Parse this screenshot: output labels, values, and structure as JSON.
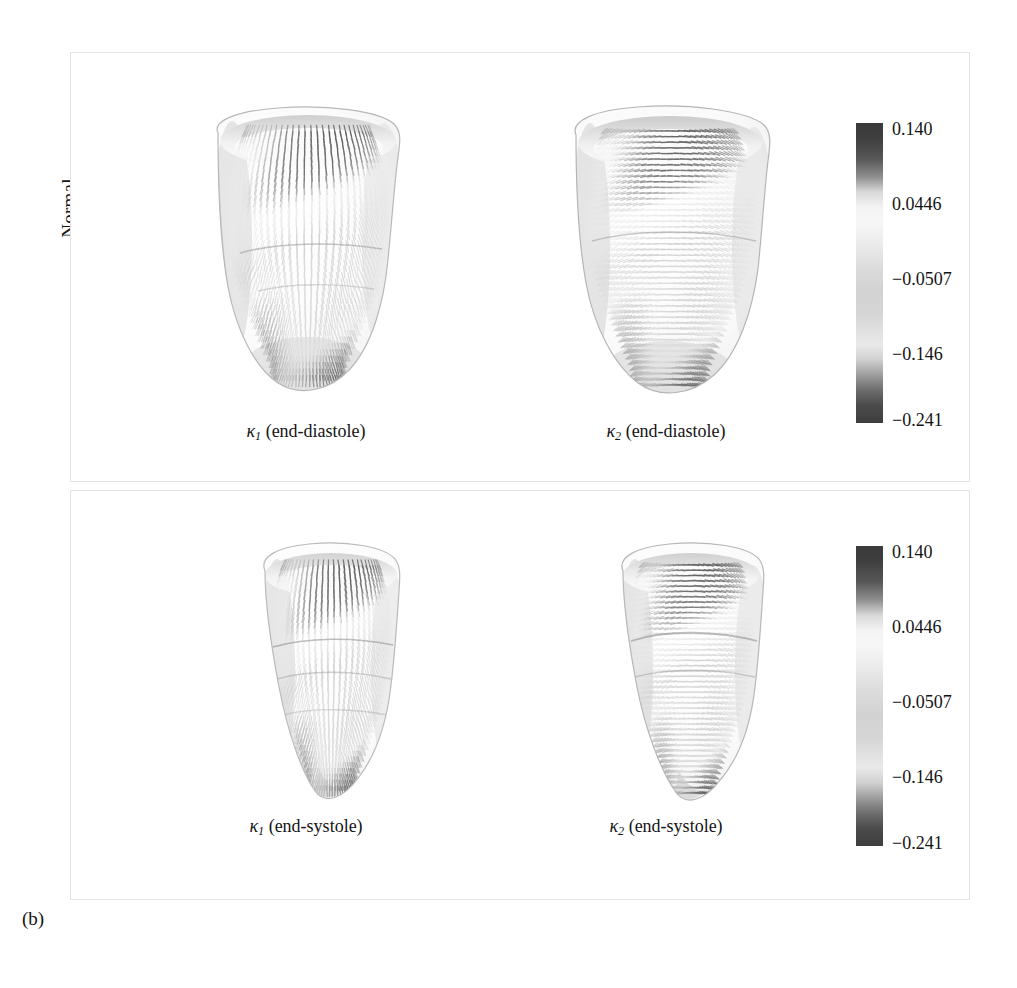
{
  "figure": {
    "caption": "(b)",
    "row_label": "Normal"
  },
  "colorbar": {
    "ticks": [
      "0.140",
      "0.0446",
      "−0.0507",
      "−0.146",
      "−0.241"
    ],
    "tick_positions_pct": [
      2,
      27,
      52,
      77,
      99
    ],
    "colormap": "grayscale-cyclic",
    "min": -0.241,
    "max": 0.14
  },
  "panels": [
    {
      "id": "panel-top",
      "phase": "end-diastole",
      "views": [
        {
          "id": "vent-k1-ed",
          "symbol": "κ",
          "subscript": "1",
          "caption_suffix": " (end-diastole)",
          "caption": "κ₁ (end-diastole)",
          "glyph_direction": "longitudinal"
        },
        {
          "id": "vent-k2-ed",
          "symbol": "κ",
          "subscript": "2",
          "caption_suffix": " (end-diastole)",
          "caption": "κ₂ (end-diastole)",
          "glyph_direction": "circumferential"
        }
      ]
    },
    {
      "id": "panel-bottom",
      "phase": "end-systole",
      "views": [
        {
          "id": "vent-k1-es",
          "symbol": "κ",
          "subscript": "1",
          "caption_suffix": " (end-systole)",
          "caption": "κ₁ (end-systole)",
          "glyph_direction": "longitudinal"
        },
        {
          "id": "vent-k2-es",
          "symbol": "κ",
          "subscript": "2",
          "caption_suffix": " (end-systole)",
          "caption": "κ₂ (end-systole)",
          "glyph_direction": "circumferential"
        }
      ]
    }
  ],
  "chart_data": {
    "type": "heatmap",
    "title": "",
    "xlabel": "",
    "ylabel": "",
    "colorbar_ticks": [
      "0.140",
      "0.0446",
      "−0.0507",
      "−0.146",
      "−0.241"
    ],
    "value_range": [
      -0.241,
      0.14
    ],
    "panels": [
      "κ₁ (end-diastole)",
      "κ₂ (end-diastole)",
      "κ₁ (end-systole)",
      "κ₂ (end-systole)"
    ],
    "row_label": "Normal",
    "legend_position": "right"
  }
}
